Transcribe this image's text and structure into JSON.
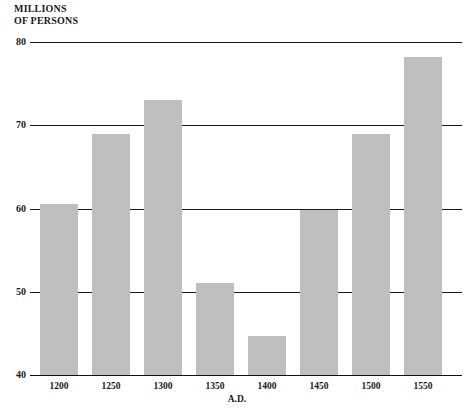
{
  "chart_data": {
    "type": "bar",
    "title": "",
    "ylabel": "MILLIONS\nOF PERSONS",
    "xlabel": "A.D.",
    "categories": [
      "1200",
      "1250",
      "1300",
      "1350",
      "1400",
      "1450",
      "1500",
      "1550"
    ],
    "values": [
      60.5,
      69,
      73,
      51,
      44.7,
      59.8,
      69,
      78.2
    ],
    "ylim": [
      40,
      80
    ],
    "yticks": [
      40,
      50,
      60,
      70,
      80
    ],
    "ytick_labels": [
      "40",
      "50",
      "60",
      "70",
      "80"
    ],
    "grid": true,
    "legend": false,
    "bar_color": "#bfbfbf",
    "axis_color": "#1a1a1a",
    "background": "#ffffff"
  },
  "axis": {
    "y_title": "MILLIONS\nOF PERSONS",
    "x_title": "A.D."
  }
}
